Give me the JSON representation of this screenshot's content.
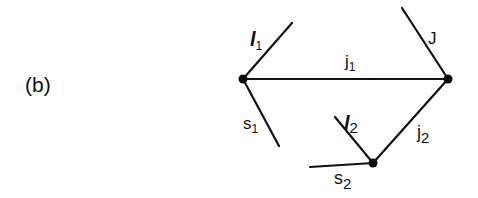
{
  "figure": {
    "panel_label": "(b)",
    "stroke_color": "#111111",
    "background": "#ffffff"
  },
  "nodes": [
    {
      "id": "left",
      "x": 243,
      "y": 79
    },
    {
      "id": "right",
      "x": 448,
      "y": 79
    },
    {
      "id": "bottom",
      "x": 373,
      "y": 163
    }
  ],
  "edges": [
    {
      "id": "l1",
      "label_main": "l",
      "label_sub": "1",
      "from": [
        243,
        79
      ],
      "to": [
        292,
        23
      ],
      "label_pos": [
        251,
        46
      ]
    },
    {
      "id": "s1",
      "label_main": "s",
      "label_sub": "1",
      "from": [
        243,
        79
      ],
      "to": [
        279,
        146
      ],
      "label_pos": [
        243,
        129
      ]
    },
    {
      "id": "j1",
      "label_main": "j",
      "label_sub": "1",
      "from": [
        243,
        79
      ],
      "to": [
        448,
        79
      ],
      "label_pos": [
        349,
        68
      ]
    },
    {
      "id": "J",
      "label_main": "J",
      "label_sub": "",
      "from": [
        448,
        79
      ],
      "to": [
        402,
        8
      ],
      "label_pos": [
        430,
        44
      ]
    },
    {
      "id": "j2",
      "label_main": "j",
      "label_sub": "2",
      "from": [
        448,
        79
      ],
      "to": [
        373,
        163
      ],
      "label_pos": [
        418,
        140
      ]
    },
    {
      "id": "l2",
      "label_main": "l",
      "label_sub": "2",
      "from": [
        373,
        163
      ],
      "to": [
        335,
        117
      ],
      "label_pos": [
        346,
        131
      ]
    },
    {
      "id": "s2",
      "label_main": "s",
      "label_sub": "2",
      "from": [
        373,
        163
      ],
      "to": [
        310,
        167
      ],
      "label_pos": [
        334,
        186
      ]
    }
  ]
}
